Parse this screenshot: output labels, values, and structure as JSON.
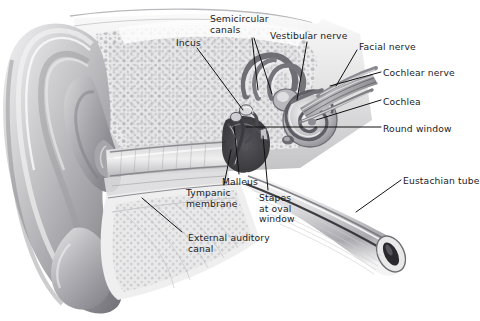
{
  "figure": {
    "background_color": "#ffffff",
    "text_color": "#1b1b1e",
    "leader_line_color": "#111111",
    "style": "grayscale pencil/airbrush medical illustration"
  },
  "labels": [
    {
      "id": "semicircular-canals",
      "text": "Semicircular\ncanals",
      "x": 210,
      "y": 14
    },
    {
      "id": "incus",
      "text": "Incus",
      "x": 176,
      "y": 38
    },
    {
      "id": "vestibular-nerve",
      "text": "Vestibular nerve",
      "x": 270,
      "y": 31
    },
    {
      "id": "facial-nerve",
      "text": "Facial nerve",
      "x": 359,
      "y": 42
    },
    {
      "id": "cochlear-nerve",
      "text": "Cochlear nerve",
      "x": 383,
      "y": 68
    },
    {
      "id": "cochlea",
      "text": "Cochlea",
      "x": 383,
      "y": 97
    },
    {
      "id": "round-window",
      "text": "Round window",
      "x": 383,
      "y": 124
    },
    {
      "id": "eustachian-tube",
      "text": "Eustachian tube",
      "x": 403,
      "y": 176
    },
    {
      "id": "malleus",
      "text": "Malleus",
      "x": 222,
      "y": 177
    },
    {
      "id": "tympanic-membrane",
      "text": "Tympanic\nmembrane",
      "x": 186,
      "y": 188
    },
    {
      "id": "stapes-at-oval-window",
      "text": "Stapes\nat oval\nwindow",
      "x": 259,
      "y": 193
    },
    {
      "id": "external-auditory-canal",
      "text": "External auditory\ncanal",
      "x": 188,
      "y": 233
    }
  ],
  "structures": [
    {
      "id": "pinna",
      "name": "Pinna (auricle)"
    },
    {
      "id": "temporal-bone",
      "name": "Temporal bone"
    },
    {
      "id": "ear-canal",
      "name": "External auditory canal"
    },
    {
      "id": "eardrum",
      "name": "Tympanic membrane"
    },
    {
      "id": "ossicles",
      "name": "Malleus, incus, stapes"
    },
    {
      "id": "semicircular-canals-structure",
      "name": "Semicircular canals"
    },
    {
      "id": "cochlea-structure",
      "name": "Cochlea"
    },
    {
      "id": "nerve-bundle",
      "name": "Vestibulocochlear and facial nerves"
    },
    {
      "id": "eustachian-tube-structure",
      "name": "Eustachian tube"
    }
  ]
}
